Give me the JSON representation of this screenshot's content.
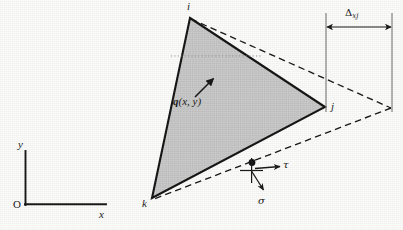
{
  "figure": {
    "background_color": "#fdfdfc",
    "element_fill_color": "#c9c9c9",
    "line_color": "#1a1a1a"
  },
  "axes": {
    "origin_label": "O",
    "x_label": "x",
    "y_label": "y",
    "x_axis_name": "horizontal-axis",
    "y_axis_name": "vertical-axis"
  },
  "element": {
    "name": "shaded-triangle",
    "vertices": [
      {
        "id": "i",
        "label": "i",
        "x": 190,
        "y": 18
      },
      {
        "id": "j",
        "label": "j",
        "x": 325,
        "y": 107
      },
      {
        "id": "k",
        "label": "k",
        "x": 152,
        "y": 198
      }
    ],
    "vertex_labels": [
      {
        "label": "i",
        "lx": 187,
        "ly": 2
      },
      {
        "label": "j",
        "lx": 331,
        "ly": 103
      },
      {
        "label": "k",
        "lx": 143,
        "ly": 200
      }
    ]
  },
  "dashed_element": {
    "name": "deformed-triangle-outline",
    "apex_x": 392,
    "apex_y": 108,
    "style": "dashed"
  },
  "load": {
    "label_q": "q",
    "label_args": "(x, y)",
    "full_label": "q(x, y)",
    "arrow_from": {
      "x": 195,
      "y": 97
    },
    "arrow_to": {
      "x": 214,
      "y": 78
    }
  },
  "stress_element": {
    "node_label": "",
    "tau_label": "τ",
    "sigma_label": "σ",
    "node_x": 252,
    "node_y": 164,
    "tau_arrow_to": {
      "x": 281,
      "y": 168
    },
    "sigma_arrow_to": {
      "x": 263,
      "y": 191
    }
  },
  "dimension": {
    "name": "delta-xj-dimension",
    "symbol": "Δ",
    "subscript": "xj",
    "full_label": "Δxj",
    "left_x": 326,
    "right_x": 392,
    "arrow_y": 27,
    "ext_top": 13,
    "ext_bottom": 112
  },
  "guideline": {
    "name": "horizontal-dotted-guide",
    "x1": 171,
    "x2": 262,
    "y": 56,
    "style": "dotted"
  }
}
